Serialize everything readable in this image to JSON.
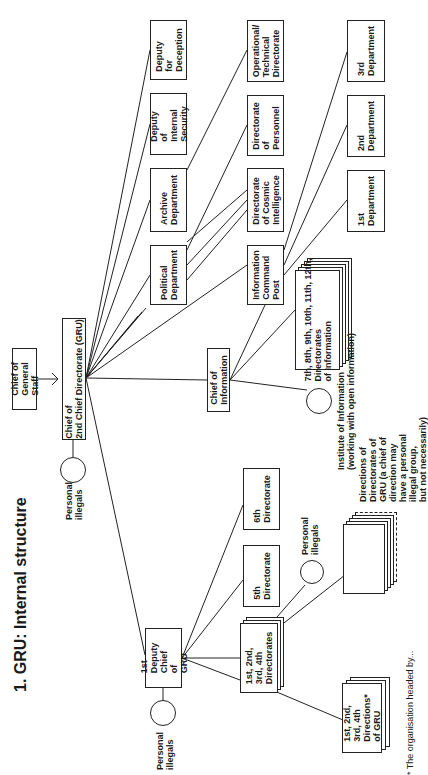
{
  "title": "1. GRU: Internal structure",
  "nodes": {
    "chief_general_staff": "Chief of\nGeneral Staff",
    "chief_gru": "Chief of\n2nd Chief Directorate (GRU)",
    "personal_illegals_top": "Personal\nillegals",
    "deputy_deception": "Deputy\nfor\nDeception",
    "deputy_internal_security": "Deputy of\nInternal\nSecurity",
    "archive_department": "Archive\nDepartment",
    "political_department": "Political\nDepartment",
    "operational_technical": "Operational/\nTechnical\nDirectorate",
    "directorate_personnel": "Directorate\nof Personnel",
    "directorate_cosmic": "Directorate\nof Cosmic\nIntelligence",
    "information_command_post": "Information\nCommand\nPost",
    "dept_3": "3rd\nDepartment",
    "dept_2": "2nd\nDepartment",
    "dept_1": "1st\nDepartment",
    "chief_information": "Chief of\nInformation",
    "directorates_information": "7th, 8th, 9th, 10th, 11th, 12th,\nDirectorates\nof Information",
    "institute_information": "Institute of Information\n(working with open information)",
    "first_deputy": "1st Deputy\nChief of GRU",
    "personal_illegals_left": "Personal\nillegals",
    "directorates_1234": "1st, 2nd,\n3rd, 4th\nDirectorates",
    "directorate_5": "5th\nDirectorate",
    "directorate_6": "6th\nDirectorate",
    "personal_illegals_mid": "Personal\nillegals",
    "directions_of_directorates": "Directions of\nDirectorates of\nGRU (a chief of\ndirection may\nhave a personal\nillegal group,\nbut not necessarily)",
    "directions_1234": "1st, 2nd,\n3rd, 4th\nDirections*\nof GRU"
  },
  "footnote": "* The organisation headed by..."
}
